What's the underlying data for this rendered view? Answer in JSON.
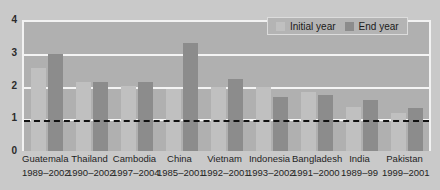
{
  "chart_data": {
    "type": "bar",
    "title": "",
    "subtitle": "",
    "xlabel": "",
    "ylabel": "",
    "ylim": [
      0,
      4
    ],
    "yticks": [
      0,
      1,
      2,
      3,
      4
    ],
    "ytick_labels": [
      "0",
      "1",
      "2",
      "3",
      "4"
    ],
    "grid": true,
    "gridlines_at": [
      1,
      2,
      3,
      4
    ],
    "reference_line": {
      "value": 1,
      "style": "dashed",
      "color": "#111111"
    },
    "legend_position": "top-right",
    "categories": [
      "Guatemala",
      "Thailand",
      "Cambodia",
      "China",
      "Vietnam",
      "Indonesia",
      "Bangladesh",
      "India",
      "Pakistan"
    ],
    "periods": [
      "1989–2002",
      "1990–2002",
      "1997–2004",
      "1985–2001",
      "1992–2001",
      "1993–2002",
      "1991–2000",
      "1989–99",
      "1999–2001"
    ],
    "series": [
      {
        "name": "Initial year",
        "color": "#c0c0c0",
        "values": [
          2.55,
          2.1,
          2.0,
          1.9,
          1.95,
          1.95,
          1.8,
          1.35,
          1.15
        ]
      },
      {
        "name": "End year",
        "color": "#8c8c8c",
        "values": [
          2.95,
          2.1,
          2.1,
          3.3,
          2.2,
          1.65,
          1.7,
          1.55,
          1.3
        ]
      }
    ]
  },
  "legend": {
    "entries": [
      {
        "label": "Initial year",
        "color": "#c0c0c0"
      },
      {
        "label": "End year",
        "color": "#8c8c8c"
      }
    ]
  },
  "colors": {
    "page_background": "#c9c9c9",
    "plot_background": "#b0b0b0",
    "gridline": "#f4f4f4",
    "initial_bar": "#c0c0c0",
    "end_bar": "#8c8c8c",
    "text": "#1f1f1f"
  }
}
